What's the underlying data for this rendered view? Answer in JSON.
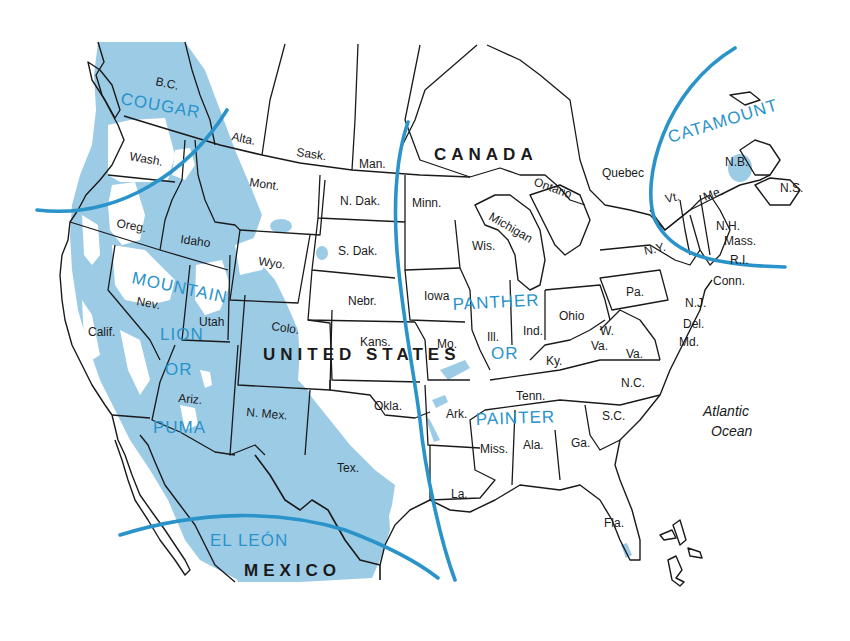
{
  "colors": {
    "range_fill": "#9ccbe6",
    "name_boundary_line": "#2a93c9",
    "name_label": "#2a93c9",
    "border": "#1a1a1a",
    "background": "#ffffff"
  },
  "countries": {
    "canada": "CANADA",
    "united_states": "UNITED STATES",
    "mexico": "MEXICO"
  },
  "ocean": {
    "line1": "Atlantic",
    "line2": "Ocean"
  },
  "common_names": {
    "cougar": "COUGAR",
    "mountain": "MOUNTAIN",
    "lion": "LION",
    "or1": "OR",
    "puma": "PUMA",
    "panther": "PANTHER",
    "or2": "OR",
    "painter": "PAINTER",
    "catamount": "CATAMOUNT",
    "el_leon": "EL LEÓN"
  },
  "provinces": {
    "bc": "B.C.",
    "alta": "Alta.",
    "sask": "Sask.",
    "man": "Man.",
    "ontario": "Ontario",
    "quebec": "Quebec",
    "nb": "N.B.",
    "ns": "N.S."
  },
  "states": {
    "wash": "Wash.",
    "oreg": "Oreg.",
    "calif": "Calif.",
    "idaho": "Idaho",
    "nev": "Nev.",
    "utah": "Utah",
    "ariz": "Ariz.",
    "mont": "Mont.",
    "wyo": "Wyo.",
    "colo": "Colo.",
    "nmex": "N. Mex.",
    "ndak": "N. Dak.",
    "sdak": "S. Dak.",
    "nebr": "Nebr.",
    "kans": "Kans.",
    "okla": "Okla.",
    "tex": "Tex.",
    "minn": "Minn.",
    "iowa": "Iowa",
    "mo": "Mo.",
    "ark": "Ark.",
    "la": "La.",
    "wis": "Wis.",
    "michigan": "Michigan",
    "ill": "Ill.",
    "ind": "Ind.",
    "ohio": "Ohio",
    "ky": "Ky.",
    "tenn": "Tenn.",
    "miss": "Miss.",
    "ala": "Ala.",
    "ga": "Ga.",
    "fla": "Fla.",
    "sc": "S.C.",
    "nc": "N.C.",
    "va": "Va.",
    "wva_1": "W.",
    "wva_2": "Va.",
    "md": "Md.",
    "del": "Del.",
    "nj": "N.J.",
    "pa": "Pa.",
    "ny": "N.Y.",
    "conn": "Conn.",
    "ri": "R.I.",
    "mass": "Mass.",
    "nh": "N.H.",
    "vt": "Vt.",
    "me": "Me."
  }
}
